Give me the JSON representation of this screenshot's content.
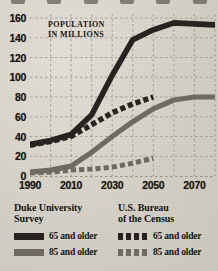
{
  "axis_note": {
    "line1": "POPULATION",
    "line2": "IN MILLIONS"
  },
  "legend": {
    "duke": {
      "title_line1": "Duke University",
      "title_line2": "Survey",
      "items": [
        {
          "swatch": "solid-dark",
          "label": "65 and older"
        },
        {
          "swatch": "solid-gray",
          "label": "85 and older"
        }
      ]
    },
    "census": {
      "title_line1": "U.S. Bureau",
      "title_line2": "of the Census",
      "items": [
        {
          "swatch": "dash-dark",
          "label": "65 and older"
        },
        {
          "swatch": "dash-gray",
          "label": "85 and older"
        }
      ]
    }
  },
  "colors": {
    "dark": "#262320",
    "gray": "#6f6b64",
    "paper": "#d8d4cb",
    "grid": "#8d8a82",
    "text": "#16140f"
  },
  "ticks": {
    "y": [
      "0",
      "20",
      "40",
      "60",
      "80",
      "100",
      "120",
      "140",
      "160"
    ],
    "x": [
      "1990",
      "2010",
      "2030",
      "2050",
      "2070"
    ]
  },
  "chart_data": {
    "type": "line",
    "title": "",
    "subtitle": "",
    "xlabel": "",
    "ylabel": "POPULATION IN MILLIONS",
    "xlim": [
      1990,
      2080
    ],
    "ylim": [
      0,
      160
    ],
    "grid": true,
    "legend_position": "below",
    "xticks": [
      1990,
      2010,
      2030,
      2050,
      2070
    ],
    "yticks": [
      0,
      20,
      40,
      60,
      80,
      100,
      120,
      140,
      160
    ],
    "series": [
      {
        "name": "Duke University Survey — 65 and older",
        "source": "Duke University Survey",
        "age_group": "65 and older",
        "style": "solid",
        "color": "#262320",
        "x": [
          1990,
          2000,
          2010,
          2020,
          2030,
          2040,
          2050,
          2060,
          2070,
          2080
        ],
        "values": [
          32,
          36,
          42,
          62,
          102,
          138,
          148,
          155,
          154,
          153
        ]
      },
      {
        "name": "Duke University Survey — 85 and older",
        "source": "Duke University Survey",
        "age_group": "85 and older",
        "style": "solid",
        "color": "#6f6b64",
        "x": [
          1990,
          2000,
          2010,
          2020,
          2030,
          2040,
          2050,
          2060,
          2070,
          2080
        ],
        "values": [
          4,
          6,
          10,
          24,
          40,
          55,
          68,
          77,
          80,
          80
        ]
      },
      {
        "name": "U.S. Bureau of the Census — 65 and older",
        "source": "U.S. Bureau of the Census",
        "age_group": "65 and older",
        "style": "dashed",
        "color": "#262320",
        "x": [
          1990,
          2000,
          2010,
          2020,
          2030,
          2040,
          2050
        ],
        "values": [
          31,
          35,
          40,
          52,
          64,
          73,
          80
        ]
      },
      {
        "name": "U.S. Bureau of the Census — 85 and older",
        "source": "U.S. Bureau of the Census",
        "age_group": "85 and older",
        "style": "dashed",
        "color": "#6f6b64",
        "x": [
          1990,
          2000,
          2010,
          2020,
          2030,
          2040,
          2050
        ],
        "values": [
          3,
          4,
          6,
          7,
          9,
          13,
          18
        ]
      }
    ]
  }
}
